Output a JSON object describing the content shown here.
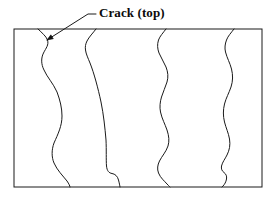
{
  "figure": {
    "type": "technical-line-diagram",
    "background_color": "#ffffff",
    "line_color": "#1a1a1a",
    "text_color": "#0b0b0b"
  },
  "annotations": {
    "crack_label": {
      "text": "Crack (top)",
      "icon": "text-annotation",
      "leader": {
        "icon": "leader-line-with-arrowhead",
        "from_x": 96,
        "from_y": 14,
        "elbow_x": 88,
        "elbow_y": 14,
        "to_x": 47,
        "to_y": 40,
        "arrowhead": "filled-triangle"
      }
    }
  },
  "specimen": {
    "name": "specimen-outline",
    "icon": "rectangle-outline",
    "x": 14,
    "y": 29,
    "width": 248,
    "height": 158,
    "stroke_width": 1
  },
  "cracks": [
    {
      "name": "crack-1",
      "icon": "crack-line",
      "top_x": 38,
      "bottom_x": 70,
      "path": "M 38 29 C 42 33, 46 36, 47.5 40 C 49 45, 46 48, 43.5 53 C 41 58, 41 64, 44 70 C 47 77, 53 83, 57 92 C 60 100, 62 108, 62 116 C 62 126, 58 134, 54 143 C 51.5 150, 51.5 157, 54 163 C 57 170, 63 176, 67 181 C 69 184, 70 186, 70 187"
    },
    {
      "name": "crack-2",
      "icon": "crack-line",
      "top_x": 96,
      "bottom_x": 120,
      "path": "M 96 29 C 93 33, 89 37, 87 41 C 85.5 44, 85 47, 85.5 50 C 86 54, 88 58, 90 63 C 94 73, 98 88, 101 102 C 103.5 114, 105 128, 106 140 C 106.5 150, 106 160, 106.5 166 C 107 171, 109 173, 112 173.5 C 115 174, 117.5 176, 118.5 180 C 119.3 183, 119.8 185.5, 120 187"
    },
    {
      "name": "crack-3",
      "icon": "crack-line",
      "top_x": 166,
      "bottom_x": 170,
      "path": "M 166 29 C 163 33, 160 36, 158.5 40 C 157 44.5, 157.5 49, 159 53 C 161 58, 164 62, 166 67 C 168 72, 168.5 77, 167 82 C 165.5 87, 163 92, 161.5 97 C 160 102, 159.5 107, 160.5 112 C 162 119, 165 124, 167 130 C 169 136, 169.5 141, 168 146 C 166 152, 162 156, 159.5 161 C 157.5 165, 157 169, 158.5 173 C 160.5 178, 164.5 181, 167 184 C 169 186, 170 187, 170 187"
    },
    {
      "name": "crack-4",
      "icon": "crack-line",
      "top_x": 234,
      "bottom_x": 222,
      "path": "M 234 29 C 231 33, 228 36, 226.5 40 C 225 44, 224.5 48, 225.5 52 C 227 58, 230 63, 231.5 69 C 233 75, 233 81, 231 87 C 229 93, 226 98, 224.5 104 C 223 110, 223 116, 224.5 122 C 226 128, 228.5 133, 229.5 139 C 230.5 145, 229.5 150, 227 155 C 225 159, 222.5 162, 221.5 166 C 221 169, 222 171, 224 172.5 C 226 174, 227 176, 226.5 179 C 226 182, 224.5 184.5, 223 186 C 222.3 186.7, 222 187, 222 187"
    }
  ]
}
